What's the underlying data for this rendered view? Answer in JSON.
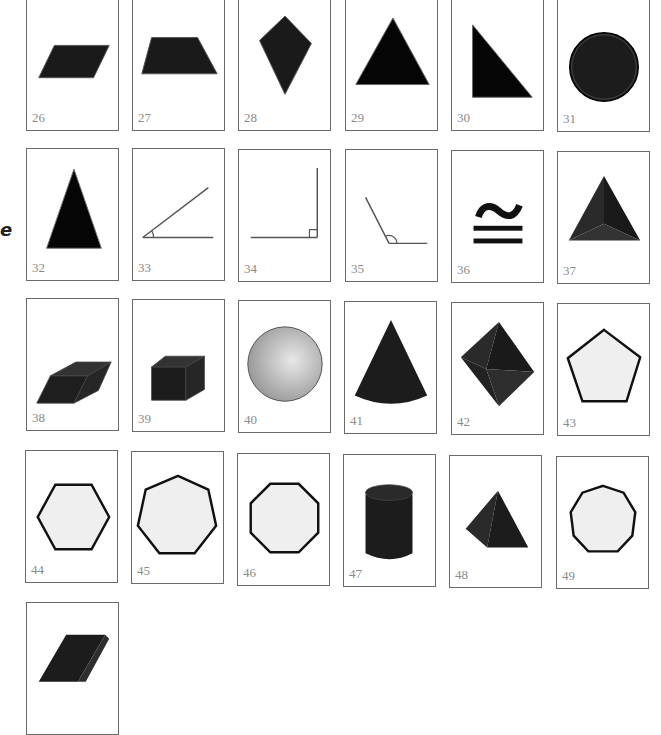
{
  "side_mark": "e",
  "colors": {
    "dark_fill": "#1a1a1a",
    "light_fill": "#efefef",
    "border": "#6a6a6a",
    "number": "#8a8a8a"
  },
  "cards": [
    {
      "number": "26",
      "shape": "parallelogram"
    },
    {
      "number": "27",
      "shape": "trapezoid"
    },
    {
      "number": "28",
      "shape": "kite"
    },
    {
      "number": "29",
      "shape": "triangle"
    },
    {
      "number": "30",
      "shape": "right-triangle"
    },
    {
      "number": "31",
      "shape": "circle"
    },
    {
      "number": "32",
      "shape": "isosceles-triangle"
    },
    {
      "number": "33",
      "shape": "acute-angle"
    },
    {
      "number": "34",
      "shape": "right-angle"
    },
    {
      "number": "35",
      "shape": "obtuse-angle"
    },
    {
      "number": "36",
      "shape": "congruent-symbol"
    },
    {
      "number": "37",
      "shape": "triangular-pyramid"
    },
    {
      "number": "38",
      "shape": "parallelepiped"
    },
    {
      "number": "39",
      "shape": "cube"
    },
    {
      "number": "40",
      "shape": "sphere"
    },
    {
      "number": "41",
      "shape": "cone"
    },
    {
      "number": "42",
      "shape": "octahedron"
    },
    {
      "number": "43",
      "shape": "pentagon"
    },
    {
      "number": "44",
      "shape": "hexagon"
    },
    {
      "number": "45",
      "shape": "heptagon"
    },
    {
      "number": "46",
      "shape": "octagon"
    },
    {
      "number": "47",
      "shape": "cylinder"
    },
    {
      "number": "48",
      "shape": "square-pyramid"
    },
    {
      "number": "49",
      "shape": "nonagon"
    },
    {
      "number": "",
      "shape": "rectangular-prism"
    }
  ]
}
